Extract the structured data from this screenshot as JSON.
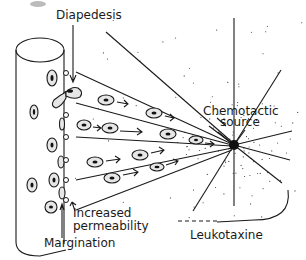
{
  "figure": {
    "labels": {
      "diapedesis": "Diapedesis",
      "chemotactic_source_line1": "Chemotactic",
      "chemotactic_source_line2": "source",
      "increased_permeability_line1": "Increased",
      "increased_permeability_line2": "permeability",
      "margination": "Margination",
      "leukotaxine": "Leukotaxine"
    },
    "elements": {
      "vessel": "blood-vessel-cylinder",
      "cells": "leukocytes migrating with arrows toward source",
      "source": "black dot with radiating lines and stippled gradient"
    },
    "colors": {
      "ink": "#1a1a1a",
      "cell_fill": "#e6e6e6",
      "background": "#ffffff"
    }
  }
}
